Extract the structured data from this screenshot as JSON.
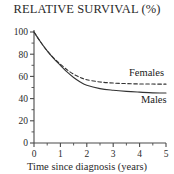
{
  "chart_data": {
    "type": "line",
    "title": "RELATIVE SURVIVAL (%)",
    "xlabel": "Time since diagnosis (years)",
    "ylabel": "",
    "xlim": [
      0,
      5
    ],
    "ylim": [
      0,
      100
    ],
    "grid": false,
    "legend_position": "inline-right",
    "x_ticks": [
      "0",
      "1",
      "2",
      "3",
      "4",
      "5"
    ],
    "x_tick_values": [
      0,
      1,
      2,
      3,
      4,
      5
    ],
    "x_minor_ticks": [
      0.5,
      1.5,
      2.5,
      3.5,
      4.5
    ],
    "y_ticks": [
      "0",
      "20",
      "40",
      "60",
      "80",
      "100"
    ],
    "y_tick_values": [
      0,
      20,
      40,
      60,
      80,
      100
    ],
    "y_minor_ticks": [
      10,
      30,
      50,
      70,
      90
    ],
    "x": [
      0,
      0.25,
      0.5,
      0.75,
      1,
      1.25,
      1.5,
      1.75,
      2,
      2.5,
      3,
      3.5,
      4,
      4.5,
      5
    ],
    "series": [
      {
        "name": "Males",
        "style": "solid",
        "color": "#333333",
        "label": "Males",
        "label_x": 4.05,
        "label_y": 36,
        "values": [
          100,
          91,
          83,
          76,
          70,
          64,
          59,
          55,
          52,
          49,
          47.5,
          46.5,
          45.8,
          45.2,
          45
        ]
      },
      {
        "name": "Females",
        "style": "dashed",
        "color": "#333333",
        "label": "Females",
        "label_x": 3.6,
        "label_y": 60,
        "values": [
          100,
          91,
          83,
          76.5,
          71,
          66,
          62,
          59,
          57,
          55,
          54,
          53.5,
          53.2,
          53.1,
          53
        ]
      }
    ]
  },
  "axes": {
    "y_axis_name": "relative-survival-percent",
    "x_axis_name": "time-since-diagnosis-years"
  }
}
